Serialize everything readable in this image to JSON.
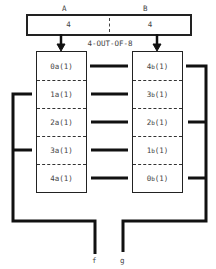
{
  "diagram": {
    "top_register": {
      "label_a": "A",
      "label_b": "B",
      "value_a": "4",
      "value_b": "4",
      "caption": "4-OUT-OF-8"
    },
    "left_stack": {
      "rows": [
        {
          "digit": "0",
          "sub": "a",
          "suffix": "(1)"
        },
        {
          "digit": "1",
          "sub": "a",
          "suffix": "(1)"
        },
        {
          "digit": "2",
          "sub": "a",
          "suffix": "(1)"
        },
        {
          "digit": "3",
          "sub": "a",
          "suffix": "(1)"
        },
        {
          "digit": "4",
          "sub": "a",
          "suffix": "(1)"
        }
      ]
    },
    "right_stack": {
      "rows": [
        {
          "digit": "4",
          "sub": "b",
          "suffix": "(1)"
        },
        {
          "digit": "3",
          "sub": "b",
          "suffix": "(1)"
        },
        {
          "digit": "2",
          "sub": "b",
          "suffix": "(1)"
        },
        {
          "digit": "1",
          "sub": "b",
          "suffix": "(1)"
        },
        {
          "digit": "0",
          "sub": "b",
          "suffix": "(1)"
        }
      ]
    },
    "outputs": {
      "left": "f",
      "right": "g"
    }
  }
}
